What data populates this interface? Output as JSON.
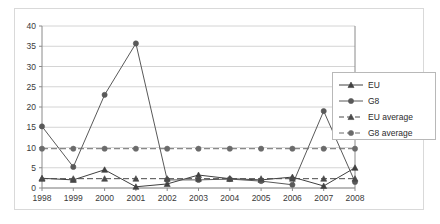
{
  "chart_data": {
    "type": "line",
    "title": "",
    "xlabel": "",
    "ylabel": "",
    "categories": [
      "1998",
      "1999",
      "2000",
      "2001",
      "2002",
      "2003",
      "2004",
      "2005",
      "2006",
      "2007",
      "2008"
    ],
    "ylim": [
      0,
      40
    ],
    "ytick_step": 5,
    "yticks": [
      "0",
      "5",
      "10",
      "15",
      "20",
      "25",
      "30",
      "35",
      "40"
    ],
    "grid": true,
    "legend_position": "right",
    "series": [
      {
        "name": "EU",
        "marker": "triangle",
        "style": "solid",
        "color": "#404040",
        "values": [
          2.4,
          2.0,
          4.5,
          0.3,
          1.0,
          3.2,
          2.3,
          2.0,
          2.7,
          0.5,
          5.0
        ]
      },
      {
        "name": "G8",
        "marker": "circle",
        "style": "solid",
        "color": "#595959",
        "values": [
          15.2,
          5.2,
          23.0,
          35.7,
          2.0,
          2.0,
          2.2,
          1.7,
          0.8,
          19.0,
          1.5
        ]
      },
      {
        "name": "EU average",
        "marker": "triangle",
        "style": "dashed",
        "color": "#4a4a4a",
        "constant": 2.3
      },
      {
        "name": "G8 average",
        "marker": "circle",
        "style": "dashed",
        "color": "#6b6b6b",
        "constant": 9.7
      }
    ]
  },
  "legend": {
    "items": [
      {
        "label": "EU"
      },
      {
        "label": "G8"
      },
      {
        "label": "EU average"
      },
      {
        "label": "G8 average"
      }
    ]
  },
  "colors": {
    "frame": "#d9d9d9",
    "grid": "#c9c9c9",
    "axis": "#8a8a8a",
    "text": "#3a3a3a"
  }
}
